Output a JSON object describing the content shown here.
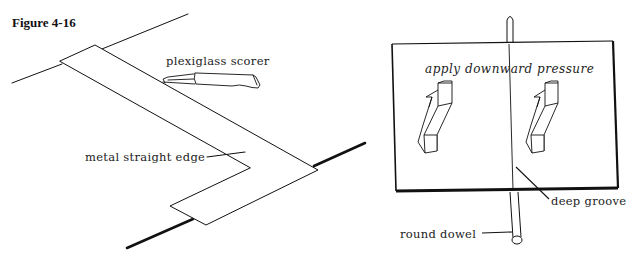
{
  "figure": {
    "title": "Figure 4-16"
  },
  "left_panel": {
    "labels": {
      "scorer": "plexiglass scorer",
      "straight_edge": "metal straight edge"
    }
  },
  "right_panel": {
    "labels": {
      "instruction": "apply downward pressure",
      "groove": "deep groove",
      "dowel": "round dowel"
    }
  },
  "colors": {
    "ink": "#111111",
    "background": "#ffffff"
  }
}
